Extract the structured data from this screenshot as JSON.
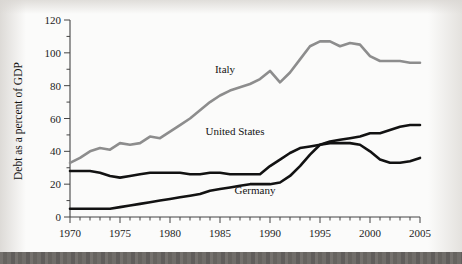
{
  "chart_data": {
    "type": "line",
    "title": "",
    "xlabel": "",
    "ylabel": "Debt as a percent of GDP",
    "xlim": [
      1970,
      2005
    ],
    "ylim": [
      0,
      120
    ],
    "grid": false,
    "legend_position": "inline-annotations",
    "x_tick_labels": [
      "1970",
      "1975",
      "1980",
      "1985",
      "1990",
      "1995",
      "2000",
      "2005"
    ],
    "x_tick_values": [
      1970,
      1975,
      1980,
      1985,
      1990,
      1995,
      2000,
      2005
    ],
    "x_minor_tick_interval": 1,
    "y_tick_labels": [
      "0",
      "20",
      "40",
      "60",
      "80",
      "100",
      "120"
    ],
    "y_tick_values": [
      0,
      20,
      40,
      60,
      80,
      100,
      120
    ],
    "y_minor_tick_interval": 10,
    "x": [
      1970,
      1971,
      1972,
      1973,
      1974,
      1975,
      1976,
      1977,
      1978,
      1979,
      1980,
      1981,
      1982,
      1983,
      1984,
      1985,
      1986,
      1987,
      1988,
      1989,
      1990,
      1991,
      1992,
      1993,
      1994,
      1995,
      1996,
      1997,
      1998,
      1999,
      2000,
      2001,
      2002,
      2003,
      2004,
      2005
    ],
    "series": [
      {
        "name": "Italy",
        "color": "#8d8d8d",
        "label_text": "Italy",
        "values": [
          33,
          36,
          40,
          42,
          41,
          45,
          44,
          45,
          49,
          48,
          52,
          56,
          60,
          65,
          70,
          74,
          77,
          79,
          81,
          84,
          89,
          82,
          88,
          96,
          104,
          107,
          107,
          104,
          106,
          105,
          98,
          95,
          95,
          95,
          94,
          94
        ]
      },
      {
        "name": "United States",
        "color": "#121212",
        "label_text": "United States",
        "values": [
          28,
          28,
          28,
          27,
          25,
          24,
          25,
          26,
          27,
          27,
          27,
          27,
          26,
          26,
          27,
          27,
          26,
          26,
          26,
          26,
          31,
          35,
          39,
          42,
          43,
          44,
          45,
          45,
          45,
          44,
          40,
          35,
          33,
          33,
          34,
          36
        ]
      },
      {
        "name": "Germany",
        "color": "#121212",
        "label_text": "Germany",
        "values": [
          5,
          5,
          5,
          5,
          5,
          6,
          7,
          8,
          9,
          10,
          11,
          12,
          13,
          14,
          16,
          17,
          18,
          19,
          20,
          20,
          20,
          21,
          25,
          31,
          38,
          44,
          46,
          47,
          48,
          49,
          51,
          51,
          53,
          55,
          56,
          56
        ]
      }
    ],
    "annotations": [
      {
        "text": "Italy",
        "x": 1985.5,
        "y": 88
      },
      {
        "text": "United States",
        "x": 1986.5,
        "y": 50
      },
      {
        "text": "Germany",
        "x": 1988.5,
        "y": 14
      }
    ]
  },
  "figure": {
    "caption": ""
  }
}
